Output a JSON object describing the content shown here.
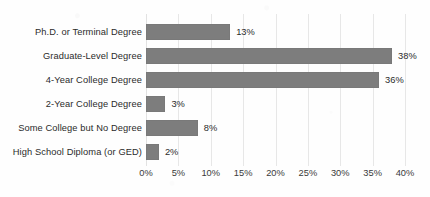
{
  "chart_data": {
    "type": "bar",
    "orientation": "horizontal",
    "title": "",
    "subtitle": "",
    "xlabel": "",
    "ylabel": "",
    "xlim": [
      0,
      40
    ],
    "xtick_step": 5,
    "grid": true,
    "legend": false,
    "value_label_suffix": "%",
    "bar_color": "#7d7d7d",
    "gridline_color": "#e7e7e7",
    "text_color": "#2b2b2b",
    "background_color": "#ffffff",
    "categories": [
      "Ph.D. or Terminal Degree",
      "Graduate-Level Degree",
      "4-Year College Degree",
      "2-Year College Degree",
      "Some College but No Degree",
      "High School Diploma (or GED)"
    ],
    "values": [
      13,
      38,
      36,
      3,
      8,
      2
    ],
    "value_labels": [
      "13%",
      "38%",
      "36%",
      "3%",
      "8%",
      "2%"
    ],
    "xticks": [
      0,
      5,
      10,
      15,
      20,
      25,
      30,
      35,
      40
    ],
    "xtick_labels": [
      "0%",
      "5%",
      "10%",
      "15%",
      "20%",
      "25%",
      "30%",
      "35%",
      "40%"
    ]
  }
}
